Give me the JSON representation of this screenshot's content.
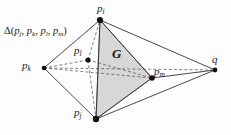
{
  "figure": {
    "caption_label": "Δ(p_j, p_k, p_l, p_m)",
    "region_label": "G",
    "background_color": "#fdfdfd",
    "line_color": "#2a2a2a",
    "dashed_color": "#555555",
    "shade_color": "#d8d8d8",
    "vertex_color": "#111111"
  },
  "set_label": {
    "delta": "Δ",
    "open_paren": "(",
    "close_paren": ")",
    "separator": ",",
    "members": [
      {
        "base": "p",
        "sub": "j"
      },
      {
        "base": "p",
        "sub": "k"
      },
      {
        "base": "p",
        "sub": "l"
      },
      {
        "base": "p",
        "sub": "m"
      }
    ]
  },
  "vertices": [
    {
      "id": "pi",
      "base": "p",
      "sub": "i",
      "label": "p_i",
      "x": 100,
      "y": 20,
      "label_x": 97,
      "label_y": 3,
      "dot": true
    },
    {
      "id": "pk",
      "base": "p",
      "sub": "k",
      "label": "p_k",
      "x": 44,
      "y": 68,
      "label_x": 22,
      "label_y": 60,
      "dot": true
    },
    {
      "id": "pl",
      "base": "p",
      "sub": "l",
      "label": "p_l",
      "x": 88,
      "y": 60,
      "label_x": 74,
      "label_y": 45,
      "dot": true
    },
    {
      "id": "pm",
      "base": "p",
      "sub": "m",
      "label": "p_m",
      "x": 152,
      "y": 78,
      "label_x": 154,
      "label_y": 66,
      "dot": true
    },
    {
      "id": "pj",
      "base": "p",
      "sub": "j",
      "label": "p_j",
      "x": 96,
      "y": 119,
      "label_x": 74,
      "label_y": 107,
      "dot": true
    },
    {
      "id": "q",
      "base": "q",
      "sub": "",
      "label": "q",
      "x": 215,
      "y": 70,
      "label_x": 212,
      "label_y": 54,
      "dot": true
    }
  ],
  "solid_edges": [
    {
      "from": "pi",
      "to": "pk"
    },
    {
      "from": "pi",
      "to": "pj"
    },
    {
      "from": "pi",
      "to": "pm"
    },
    {
      "from": "pi",
      "to": "q"
    },
    {
      "from": "pk",
      "to": "pj"
    },
    {
      "from": "pj",
      "to": "pm"
    },
    {
      "from": "pj",
      "to": "q"
    },
    {
      "from": "pm",
      "to": "q"
    }
  ],
  "dashed_edges": [
    {
      "from": "pk",
      "to": "pl"
    },
    {
      "from": "pk",
      "to": "pm"
    },
    {
      "from": "pl",
      "to": "pi"
    },
    {
      "from": "pl",
      "to": "pj"
    },
    {
      "from": "pl",
      "to": "pm"
    },
    {
      "from": "pk",
      "to": "q"
    }
  ],
  "shaded_region": {
    "name": "G",
    "polygon": "100,20 152,78 96,119"
  }
}
